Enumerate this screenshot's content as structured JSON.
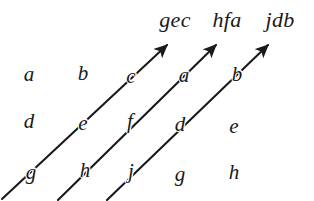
{
  "figure": {
    "background_color": "#ffffff",
    "ink_color": "#1a1a1a",
    "width": 314,
    "height": 201,
    "arrow_labels": [
      {
        "id": "arrow-1-label",
        "text": "gec",
        "x": 175,
        "y": 20
      },
      {
        "id": "arrow-2-label",
        "text": "hfa",
        "x": 227,
        "y": 20
      },
      {
        "id": "arrow-3-label",
        "text": "jdb",
        "x": 280,
        "y": 20
      }
    ],
    "arrows": [
      {
        "id": "arrow-1",
        "x1": 2,
        "y1": 199,
        "x2": 167,
        "y2": 45
      },
      {
        "id": "arrow-2",
        "x1": 58,
        "y1": 200,
        "x2": 216,
        "y2": 45
      },
      {
        "id": "arrow-3",
        "x1": 107,
        "y1": 200,
        "x2": 268,
        "y2": 45
      }
    ],
    "letters": [
      {
        "id": "letter-a-row1",
        "text": "a",
        "x": 29,
        "y": 74,
        "on_line": false
      },
      {
        "id": "letter-b-row1",
        "text": "b",
        "x": 83,
        "y": 73,
        "on_line": false
      },
      {
        "id": "letter-c-row1",
        "text": "c",
        "x": 131,
        "y": 76,
        "on_line": true
      },
      {
        "id": "letter-a-row1-right",
        "text": "a",
        "x": 184,
        "y": 75,
        "on_line": true
      },
      {
        "id": "letter-b-row1-right",
        "text": "b",
        "x": 237,
        "y": 74,
        "on_line": true
      },
      {
        "id": "letter-d-row2",
        "text": "d",
        "x": 29,
        "y": 121,
        "on_line": false
      },
      {
        "id": "letter-e-row2",
        "text": "e",
        "x": 83,
        "y": 123,
        "on_line": true
      },
      {
        "id": "letter-f-row2",
        "text": "f",
        "x": 130,
        "y": 121,
        "on_line": true
      },
      {
        "id": "letter-d-row2-right",
        "text": "d",
        "x": 180,
        "y": 124,
        "on_line": true
      },
      {
        "id": "letter-e-row2-right",
        "text": "e",
        "x": 234,
        "y": 126,
        "on_line": false
      },
      {
        "id": "letter-g-row3",
        "text": "g",
        "x": 31,
        "y": 172,
        "on_line": true
      },
      {
        "id": "letter-h-row3",
        "text": "h",
        "x": 85,
        "y": 170,
        "on_line": true
      },
      {
        "id": "letter-j-row3",
        "text": "j",
        "x": 131,
        "y": 171,
        "on_line": true
      },
      {
        "id": "letter-g-row3-right",
        "text": "g",
        "x": 180,
        "y": 174,
        "on_line": false
      },
      {
        "id": "letter-h-row3-right",
        "text": "h",
        "x": 234,
        "y": 172,
        "on_line": false
      }
    ]
  }
}
